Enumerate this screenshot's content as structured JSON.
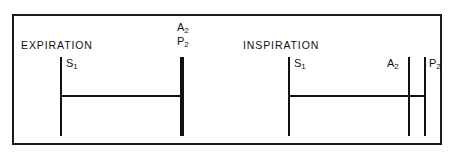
{
  "figure": {
    "background_color": "#ffffff",
    "line_color": "#111111",
    "border_color": "#1a1a1a"
  },
  "panels": {
    "expiration": {
      "caption": "EXPIRATION",
      "markers": [
        {
          "id": "s1",
          "label_main": "S",
          "label_sub": "1"
        },
        {
          "id": "a2",
          "label_main": "A",
          "label_sub": "2"
        },
        {
          "id": "p2",
          "label_main": "P",
          "label_sub": "2"
        }
      ]
    },
    "inspiration": {
      "caption": "INSPIRATION",
      "markers": [
        {
          "id": "s1",
          "label_main": "S",
          "label_sub": "1"
        },
        {
          "id": "a2",
          "label_main": "A",
          "label_sub": "2"
        },
        {
          "id": "p2",
          "label_main": "P",
          "label_sub": "2"
        }
      ]
    }
  }
}
